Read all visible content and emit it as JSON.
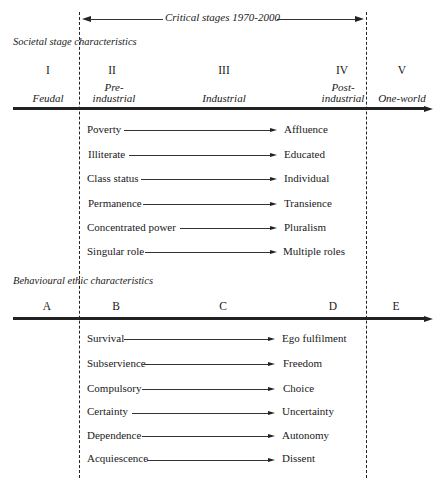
{
  "critical_stages": {
    "label": "Critical stages 1970-2000"
  },
  "societal": {
    "title": "Societal stage characteristics",
    "stages": [
      {
        "num": "I",
        "name": "Feudal"
      },
      {
        "num": "II",
        "name_line1": "Pre-",
        "name_line2": "industrial"
      },
      {
        "num": "III",
        "name": "Industrial"
      },
      {
        "num": "IV",
        "name_line1": "Post-",
        "name_line2": "industrial"
      },
      {
        "num": "V",
        "name": "One-world"
      }
    ],
    "transitions": [
      {
        "from": "Poverty",
        "to": "Affluence"
      },
      {
        "from": "Illiterate",
        "to": "Educated"
      },
      {
        "from": "Class status",
        "to": "Individual"
      },
      {
        "from": "Permanence",
        "to": "Transience"
      },
      {
        "from": "Concentrated power",
        "to": "Pluralism"
      },
      {
        "from": "Singular role",
        "to": "Multiple roles"
      }
    ]
  },
  "behavioural": {
    "title": "Behavioural ethic characteristics",
    "stages": [
      {
        "letter": "A"
      },
      {
        "letter": "B"
      },
      {
        "letter": "C"
      },
      {
        "letter": "D"
      },
      {
        "letter": "E"
      }
    ],
    "transitions": [
      {
        "from": "Survival",
        "to": "Ego fulfilment"
      },
      {
        "from": "Subservience",
        "to": "Freedom"
      },
      {
        "from": "Compulsory",
        "to": "Choice"
      },
      {
        "from": "Certainty",
        "to": "Uncertainty"
      },
      {
        "from": "Dependence",
        "to": "Autonomy"
      },
      {
        "from": "Acquiescence",
        "to": "Dissent"
      }
    ]
  }
}
